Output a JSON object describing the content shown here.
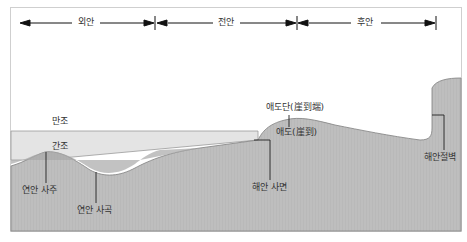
{
  "zones": [
    {
      "label": "외안"
    },
    {
      "label": "전안"
    },
    {
      "label": "후안"
    }
  ],
  "tides": {
    "high": "만조",
    "low": "간조"
  },
  "features": {
    "sandbar": "연안 사주",
    "trough": "연안 사곡",
    "beach_face": "해안 사면",
    "berm": "애도(崖到)",
    "berm_crest": "애도단(崖到端)",
    "cliff": "해안절벽"
  },
  "colors": {
    "land": "#bdbdbd",
    "water_low": "#a9a9a9",
    "intertidal": "#e6e6e6",
    "outline": "#7a7a7a"
  }
}
